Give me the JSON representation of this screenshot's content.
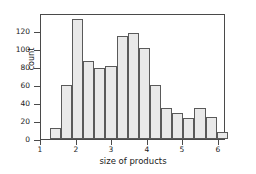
{
  "chart_data": {
    "type": "bar",
    "title": "",
    "subtitle": "",
    "xlabel": "size of products",
    "ylabel": "count",
    "xlim": [
      1.0,
      6.2
    ],
    "ylim": [
      0,
      140
    ],
    "grid": false,
    "legend": null,
    "bin_edges": [
      1.25,
      1.5625,
      1.875,
      2.1875,
      2.5,
      2.8125,
      3.125,
      3.4375,
      3.75,
      4.0625,
      4.375,
      4.6875,
      5.0,
      5.3125,
      5.625,
      5.9375,
      6.25
    ],
    "categories": [
      "1.25-1.56",
      "1.56-1.88",
      "1.88-2.19",
      "2.19-2.50",
      "2.50-2.81",
      "2.81-3.13",
      "3.13-3.44",
      "3.44-3.75",
      "3.75-4.06",
      "4.06-4.38",
      "4.38-4.69",
      "4.69-5.00",
      "5.00-5.31",
      "5.31-5.63",
      "5.63-5.94",
      "5.94-6.25"
    ],
    "values": [
      12,
      60,
      133,
      87,
      79,
      81,
      114,
      118,
      101,
      60,
      35,
      29,
      23,
      35,
      24,
      8
    ],
    "xticks": [
      1,
      2,
      3,
      4,
      5,
      6
    ],
    "xticklabels": [
      "1",
      "2",
      "3",
      "4",
      "5",
      "6"
    ],
    "yticks": [
      0,
      20,
      40,
      60,
      80,
      100,
      120
    ],
    "yticklabels": [
      "0",
      "20",
      "40",
      "60",
      "80",
      "100",
      "120"
    ],
    "bar_fill_color": "#e9e9e9",
    "bar_edge_color": "#5a5a5a",
    "axis_color": "#4a4a4a",
    "text_color": "#1a1a1a",
    "background_color": "#ffffff"
  }
}
